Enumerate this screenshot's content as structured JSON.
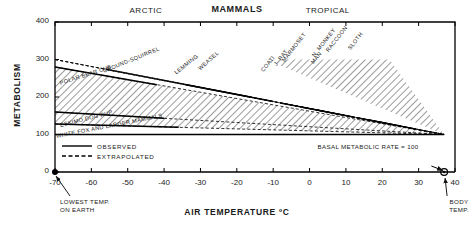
{
  "chart_data": {
    "type": "line",
    "title": "MAMMALS",
    "xlabel": "AIR TEMPERATURE ºC",
    "ylabel": "METABOLISM",
    "xlim": [
      -70,
      40
    ],
    "ylim": [
      0,
      400
    ],
    "xticks": [
      -70,
      -60,
      -50,
      -40,
      -30,
      -20,
      -10,
      0,
      10,
      20,
      30,
      40
    ],
    "xtick_labels": [
      "-70",
      "-60",
      "-50",
      "-40",
      "-30",
      "-20",
      "-10",
      "0",
      "10",
      "20",
      "30",
      "40"
    ],
    "yticks": [
      0,
      100,
      200,
      300,
      400
    ],
    "ytick_labels": [
      "0",
      "100",
      "200",
      "300",
      "400"
    ],
    "grid": false,
    "region_labels": [
      {
        "text": "ARCTIC",
        "x": -45
      },
      {
        "text": "TROPICAL",
        "x": 5
      }
    ],
    "baseline": {
      "value": 100,
      "label": "BASAL METABOLIC RATE = 100"
    },
    "legend": [
      {
        "label": "OBSERVED",
        "style": "solid"
      },
      {
        "label": "EXTRAPOLATED",
        "style": "dashed"
      }
    ],
    "annotations": [
      {
        "name": "lowest-temp",
        "text": "LOWEST TEMP.\nON EARTH",
        "x": -70,
        "y": 0
      },
      {
        "name": "body-temp",
        "text": "BODY\nTEMP.",
        "x": 37,
        "y": 0
      }
    ],
    "series": [
      {
        "name": "POLAR BEAR CUB",
        "group": "arctic",
        "x_intercept": 37,
        "y_at_min": 280,
        "solid_from": -70,
        "solid_to": -42
      },
      {
        "name": "GROUND-SQUIRREL",
        "group": "arctic",
        "x_intercept": 37,
        "y_at_min": 300,
        "solid_from": -56,
        "solid_to": -26
      },
      {
        "name": "LEMMING",
        "group": "arctic",
        "x_intercept": 37,
        "y_at_min": 300,
        "solid_from": -34,
        "solid_to": -16
      },
      {
        "name": "WEASEL",
        "group": "arctic",
        "x_intercept": 37,
        "y_at_min": 300,
        "solid_from": -26,
        "solid_to": -10
      },
      {
        "name": "ESKIMO DOG PUP",
        "group": "arctic",
        "x_intercept": 37,
        "y_at_min": 160,
        "solid_from": -70,
        "solid_to": -40
      },
      {
        "name": "WHITE FOX AND LARGER MAMMALS",
        "group": "arctic",
        "x_intercept": 37,
        "y_at_min": 128,
        "solid_from": -70,
        "solid_to": -36
      },
      {
        "name": "COATI",
        "group": "tropical",
        "x_intercept": 37,
        "y_at_min": 300,
        "solid_from": -8,
        "solid_to": 4
      },
      {
        "name": "J. RAT",
        "group": "tropical",
        "x_intercept": 37,
        "y_at_min": 300,
        "solid_from": -2,
        "solid_to": 9
      },
      {
        "name": "MARMOSET",
        "group": "tropical",
        "x_intercept": 37,
        "y_at_min": 300,
        "solid_from": 2,
        "solid_to": 12
      },
      {
        "name": "MAN",
        "group": "tropical",
        "x_intercept": 37,
        "y_at_min": 300,
        "solid_from": 13,
        "solid_to": 21
      },
      {
        "name": "N. MONKEY",
        "group": "tropical",
        "x_intercept": 37,
        "y_at_min": 300,
        "solid_from": 16,
        "solid_to": 23
      },
      {
        "name": "RACCOON",
        "group": "tropical",
        "x_intercept": 37,
        "y_at_min": 300,
        "solid_from": 19,
        "solid_to": 25
      },
      {
        "name": "SLOTH",
        "group": "tropical",
        "x_intercept": 37,
        "y_at_min": 300,
        "solid_from": 24,
        "solid_to": 29
      }
    ],
    "species_labels": [
      {
        "name": "POLAR BEAR CUB",
        "lx": 60,
        "ly": 80,
        "rot": -18
      },
      {
        "name": "GROUND-SQUIRREL",
        "lx": 103,
        "ly": 68,
        "rot": -22
      },
      {
        "name": "LEMMING",
        "lx": 175,
        "ly": 70,
        "rot": -38
      },
      {
        "name": "WEASEL",
        "lx": 199,
        "ly": 66,
        "rot": -42
      },
      {
        "name": "ESKIMO DOG PUP",
        "lx": 60,
        "ly": 122,
        "rot": -14
      },
      {
        "name": "WHITE FOX AND LARGER MAMMALS",
        "lx": 56,
        "ly": 133,
        "rot": -11
      },
      {
        "name": "COATI",
        "lx": 262,
        "ly": 68,
        "rot": -52
      },
      {
        "name": "J. RAT",
        "lx": 275,
        "ly": 62,
        "rot": -52
      },
      {
        "name": "MARMOSET",
        "lx": 283,
        "ly": 58,
        "rot": -52
      },
      {
        "name": "MAN",
        "lx": 312,
        "ly": 60,
        "rot": -52
      },
      {
        "name": "N. MONKEY",
        "lx": 313,
        "ly": 53,
        "rot": -52
      },
      {
        "name": "RACCOON",
        "lx": 327,
        "ly": 48,
        "rot": -52
      },
      {
        "name": "SLOTH",
        "lx": 349,
        "ly": 46,
        "rot": -52
      }
    ]
  }
}
